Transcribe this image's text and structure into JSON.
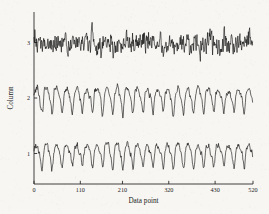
{
  "figure": {
    "background_color": "#f7f6f3",
    "trace_color": "#0d0d0d",
    "axis_color": "#2a2a2a"
  },
  "chart_data": {
    "type": "line",
    "title": "",
    "subtitle": "",
    "xlabel": "Data point",
    "ylabel": "Column",
    "xlim": [
      0,
      520
    ],
    "ylim": [
      0.45,
      3.55
    ],
    "xticks": [
      0,
      110,
      210,
      320,
      430,
      520
    ],
    "xticklabels": [
      "0",
      "110",
      "210",
      "320",
      "430",
      "520"
    ],
    "yticks": [
      1,
      2,
      3
    ],
    "yticklabels": [
      "1",
      "2",
      "3"
    ],
    "grid": false,
    "legend": null,
    "n_points": 520,
    "series": [
      {
        "name": "Column 1",
        "offset": 1,
        "waveform": "periodic",
        "period": 24,
        "amplitude": 0.18,
        "noise": 0.045,
        "seed": 17,
        "harmonic2": 0.055,
        "harmonic3": 0.03
      },
      {
        "name": "Column 2",
        "offset": 2,
        "waveform": "periodic",
        "period": 24,
        "amplitude": 0.2,
        "noise": 0.05,
        "seed": 43,
        "harmonic2": 0.06,
        "harmonic3": 0.035
      },
      {
        "name": "Column 3",
        "offset": 3,
        "waveform": "noise",
        "period": 24,
        "amplitude": 0.035,
        "noise": 0.175,
        "seed": 91,
        "harmonic2": 0.0,
        "harmonic3": 0.0
      }
    ]
  }
}
